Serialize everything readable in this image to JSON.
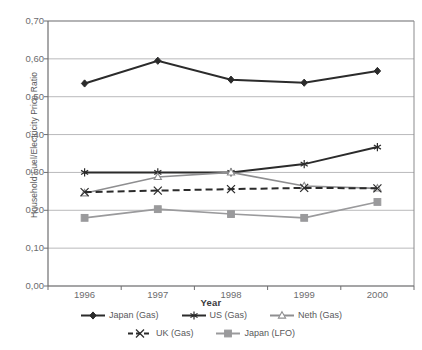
{
  "chart_data": {
    "type": "line",
    "title": "",
    "xlabel": "Year",
    "ylabel": "Household Fuel/Electricity Price Ratio",
    "categories": [
      "1996",
      "1997",
      "1998",
      "1999",
      "2000"
    ],
    "ytick_labels": [
      "0,00",
      "0,10",
      "0,20",
      "0,30",
      "0,40",
      "0,50",
      "0,60",
      "0,70"
    ],
    "ytick_values": [
      0.0,
      0.1,
      0.2,
      0.3,
      0.4,
      0.5,
      0.6,
      0.7
    ],
    "ylim": [
      0.0,
      0.7
    ],
    "grid": "horizontal",
    "legend_position": "bottom",
    "decimal_separator": ",",
    "series": [
      {
        "name": "Japan (Gas)",
        "marker": "diamond-filled",
        "color": "#2b2b2b",
        "line": "solid",
        "values": [
          0.535,
          0.595,
          0.545,
          0.537,
          0.568
        ]
      },
      {
        "name": "US (Gas)",
        "marker": "asterisk",
        "color": "#2b2b2b",
        "line": "solid",
        "values": [
          0.3,
          0.3,
          0.3,
          0.322,
          0.367
        ]
      },
      {
        "name": "Neth (Gas)",
        "marker": "triangle-open",
        "color": "#8e8e90",
        "line": "solid",
        "values": [
          0.245,
          0.288,
          0.3,
          0.264,
          0.258
        ]
      },
      {
        "name": "UK (Gas)",
        "marker": "cross",
        "color": "#2b2b2b",
        "line": "dashed",
        "values": [
          0.248,
          0.252,
          0.256,
          0.259,
          0.258
        ]
      },
      {
        "name": "Japan (LFO)",
        "marker": "square-filled",
        "color": "#9a9a9c",
        "line": "solid",
        "values": [
          0.18,
          0.203,
          0.19,
          0.18,
          0.222
        ]
      }
    ]
  },
  "legend": {
    "rows": [
      [
        "Japan (Gas)",
        "US (Gas)",
        "Neth (Gas)"
      ],
      [
        "UK (Gas)",
        "Japan (LFO)"
      ]
    ]
  },
  "axes": {
    "x_title": "Year",
    "y_title": "Household Fuel/Electricity Price Ratio"
  }
}
